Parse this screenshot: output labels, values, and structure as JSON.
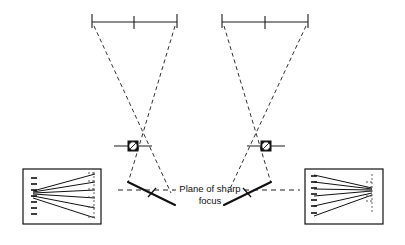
{
  "figure": {
    "title": "Plane of sharp focus",
    "type": "optical-ray-diagram",
    "background_color": "#ffffff",
    "line_color": "#1a1a1a",
    "dash_color": "#333333"
  },
  "caption": {
    "line1": "Plane of sharp",
    "line2": "focus",
    "full_text": "Plane of sharp focus"
  },
  "plane_line": {
    "label": "plane-of-sharp-focus-axis",
    "style": "dashed",
    "y": 190,
    "x_start": 118,
    "x_end": 300
  },
  "setups": [
    {
      "id": "left-setup",
      "side": "left",
      "film_plane": {
        "label": "film-plane",
        "x_left": 92,
        "x_right": 177,
        "y": 22,
        "center_tick_x": 134,
        "end_tick_length": 9
      },
      "lens": {
        "label": "lens",
        "center_x": 133,
        "center_y": 146,
        "box_size": 11,
        "circle_radius": 4.2,
        "axis_half_width": 19
      },
      "subject_plane": {
        "label": "plane-of-sharp-focus-left",
        "x1": 128,
        "y1": 182,
        "x2": 175,
        "y2": 205,
        "tilt": "down-to-right",
        "tick_x": 152,
        "tick_y": 193
      },
      "rays": [
        {
          "from_x": 94,
          "from_y": 26,
          "to_x": 171,
          "to_y": 193
        },
        {
          "from_x": 175,
          "from_y": 26,
          "to_x": 128,
          "to_y": 183
        }
      ]
    },
    {
      "id": "right-setup",
      "side": "right",
      "film_plane": {
        "label": "film-plane",
        "x_left": 222,
        "x_right": 308,
        "y": 22,
        "center_tick_x": 265,
        "end_tick_length": 9
      },
      "lens": {
        "label": "lens",
        "center_x": 266,
        "center_y": 146,
        "box_size": 11,
        "circle_radius": 4.2,
        "axis_half_width": 19
      },
      "subject_plane": {
        "label": "plane-of-sharp-focus-right",
        "x1": 224,
        "y1": 205,
        "x2": 271,
        "y2": 182,
        "tilt": "up-to-right",
        "tick_x": 247,
        "tick_y": 193
      },
      "rays": [
        {
          "from_x": 224,
          "from_y": 26,
          "to_x": 271,
          "to_y": 183
        },
        {
          "from_x": 306,
          "from_y": 26,
          "to_x": 228,
          "to_y": 193
        }
      ]
    }
  ],
  "insets": [
    {
      "id": "left-inset",
      "label": "result-image-left",
      "x": 23,
      "y": 169,
      "width": 78,
      "height": 55,
      "converge_side": "left",
      "line_count": 6,
      "description": "Perspective lines converging toward the left edge"
    },
    {
      "id": "right-inset",
      "label": "result-image-right",
      "x": 305,
      "y": 169,
      "width": 78,
      "height": 55,
      "converge_side": "right",
      "line_count": 6,
      "description": "Perspective lines converging toward the right edge"
    }
  ]
}
